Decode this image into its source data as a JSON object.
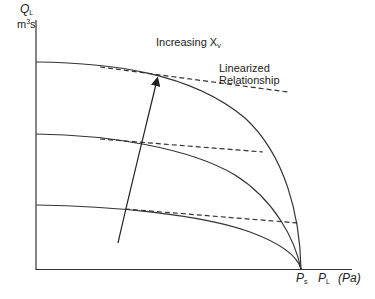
{
  "diagram": {
    "y_axis": {
      "symbol": "Q",
      "subscript": "L",
      "unit_base": "m",
      "unit_sup": "3",
      "unit_tail": "s"
    },
    "x_axis": {
      "label1": "P",
      "label1_sub": "s",
      "label2": "P",
      "label2_sub": "L",
      "unit": "(Pa)"
    },
    "arrow_label": {
      "text": "Increasing X",
      "sub": "v"
    },
    "legend_dashed": {
      "line1": "Linearized",
      "line2": "Relationship"
    },
    "curves": [
      {
        "name": "curve-high-xv",
        "q0": 62,
        "dashed_tangent": true
      },
      {
        "name": "curve-mid-xv",
        "q0": 134,
        "dashed_tangent": true
      },
      {
        "name": "curve-low-xv",
        "q0": 205,
        "dashed_tangent": true
      }
    ],
    "colors": {
      "line": "#333333",
      "background": "#ffffff"
    }
  }
}
